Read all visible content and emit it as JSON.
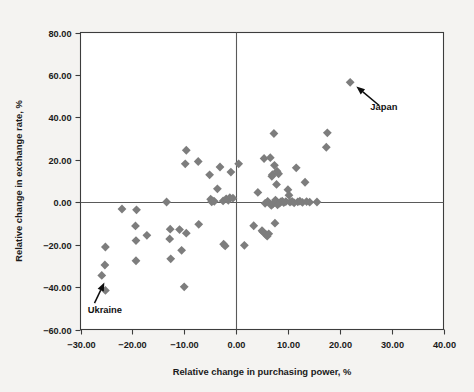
{
  "chart_data": {
    "type": "scatter",
    "title": "",
    "xlabel": "Relative change in purchasing power, %",
    "ylabel": "Relative change in exchange rate, %",
    "xlim": [
      -30,
      40
    ],
    "ylim": [
      -60,
      80
    ],
    "xticks": [
      -30,
      -20,
      -10,
      0,
      10,
      20,
      30,
      40
    ],
    "yticks": [
      -60,
      -40,
      -20,
      0,
      20,
      40,
      60,
      80
    ],
    "xtick_labels": [
      "−30.00",
      "−20.00",
      "−10.00",
      "0.00",
      "10.00",
      "20.00",
      "30.00",
      "40.00"
    ],
    "ytick_labels": [
      "−60.00",
      "−40.00",
      "−20.00",
      "0.00",
      "20.00",
      "40.00",
      "60.00",
      "80.00"
    ],
    "grid": false,
    "legend": "none",
    "marker_shape": "diamond",
    "marker_color": "#7d7d7d",
    "zero_lines": {
      "x": 0,
      "y": 0,
      "color": "#5a5a5a"
    },
    "points": [
      [
        22.0,
        56.5
      ],
      [
        -25.2,
        -21.1
      ],
      [
        -25.3,
        -29.6
      ],
      [
        -25.9,
        -34.5
      ],
      [
        -25.2,
        -41.6
      ],
      [
        -22.0,
        -3.2
      ],
      [
        -19.2,
        -3.6
      ],
      [
        -19.4,
        -11.2
      ],
      [
        -19.3,
        -18.1
      ],
      [
        -19.3,
        -27.6
      ],
      [
        -17.2,
        -15.6
      ],
      [
        -13.4,
        0.1
      ],
      [
        -12.7,
        -12.7
      ],
      [
        -12.8,
        -17.3
      ],
      [
        -12.6,
        -26.7
      ],
      [
        -10.9,
        -12.9
      ],
      [
        -10.5,
        -22.7
      ],
      [
        -10.0,
        -39.9
      ],
      [
        -9.6,
        24.5
      ],
      [
        -9.8,
        18.1
      ],
      [
        -9.6,
        -14.6
      ],
      [
        -7.3,
        19.2
      ],
      [
        -7.2,
        -10.4
      ],
      [
        -5.1,
        12.9
      ],
      [
        -4.9,
        1.4
      ],
      [
        -4.7,
        0.2
      ],
      [
        -4.5,
        0.6
      ],
      [
        -4.2,
        0.4
      ],
      [
        -3.6,
        6.3
      ],
      [
        -3.1,
        16.6
      ],
      [
        -2.5,
        0.6
      ],
      [
        -2.4,
        -19.8
      ],
      [
        -2.1,
        -20.6
      ],
      [
        -1.9,
        1.6
      ],
      [
        -1.5,
        0.9
      ],
      [
        -1.2,
        2.1
      ],
      [
        -1.0,
        14.2
      ],
      [
        -0.6,
        1.9
      ],
      [
        0.5,
        18.1
      ],
      [
        1.6,
        -20.3
      ],
      [
        3.4,
        -11.1
      ],
      [
        4.2,
        4.6
      ],
      [
        5.0,
        -13.4
      ],
      [
        5.2,
        -14.0
      ],
      [
        5.4,
        20.6
      ],
      [
        5.6,
        -0.5
      ],
      [
        5.8,
        -15.3
      ],
      [
        6.0,
        -16.0
      ],
      [
        6.1,
        0.4
      ],
      [
        6.3,
        -14.9
      ],
      [
        6.6,
        21.0
      ],
      [
        6.8,
        -1.5
      ],
      [
        6.9,
        12.2
      ],
      [
        7.0,
        13.0
      ],
      [
        7.1,
        -0.8
      ],
      [
        7.3,
        32.4
      ],
      [
        7.4,
        17.4
      ],
      [
        7.5,
        -9.9
      ],
      [
        7.6,
        1.0
      ],
      [
        7.8,
        8.4
      ],
      [
        7.9,
        14.6
      ],
      [
        8.0,
        -1.2
      ],
      [
        8.2,
        13.4
      ],
      [
        8.4,
        -0.4
      ],
      [
        8.6,
        0.2
      ],
      [
        8.9,
        0.5
      ],
      [
        9.2,
        -0.2
      ],
      [
        9.6,
        0.3
      ],
      [
        10.0,
        5.9
      ],
      [
        10.2,
        3.3
      ],
      [
        10.4,
        0.0
      ],
      [
        10.8,
        0.4
      ],
      [
        11.2,
        -0.3
      ],
      [
        11.6,
        16.2
      ],
      [
        11.9,
        0.2
      ],
      [
        12.3,
        0.5
      ],
      [
        12.8,
        -0.1
      ],
      [
        13.3,
        9.4
      ],
      [
        13.6,
        0.3
      ],
      [
        14.2,
        0.0
      ],
      [
        15.6,
        0.1
      ],
      [
        17.6,
        32.7
      ],
      [
        17.4,
        25.9
      ]
    ],
    "annotations": [
      {
        "label": "Japan",
        "point": [
          22.0,
          56.5
        ],
        "text_xy": [
          28.5,
          43.5
        ],
        "arrow_from": [
          27.6,
          45.6
        ],
        "arrow_to": [
          23.2,
          54.6
        ]
      },
      {
        "label": "Ukraine",
        "point": [
          -25.9,
          -34.5
        ],
        "text_xy": [
          -25.3,
          -52.0
        ],
        "arrow_from": [
          -27.3,
          -47.6
        ],
        "arrow_to": [
          -25.4,
          -37.8
        ]
      }
    ]
  }
}
